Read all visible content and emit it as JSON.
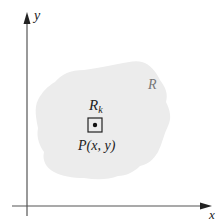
{
  "diagram": {
    "axes": {
      "x_label": "x",
      "y_label": "y"
    },
    "region": {
      "label": "R",
      "fill_color": "#ececec"
    },
    "subregion": {
      "label_main": "R",
      "label_sub": "k"
    },
    "point": {
      "label": "P(x, y)"
    },
    "colors": {
      "axis": "#333333",
      "text": "#222222",
      "region_label": "#777777"
    }
  }
}
